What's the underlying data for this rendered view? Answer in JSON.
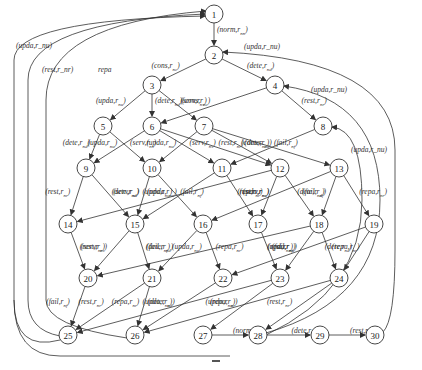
{
  "diagram": {
    "type": "state-transition-graph",
    "nodes": [
      {
        "id": "1",
        "x": 214,
        "y": 14
      },
      {
        "id": "2",
        "x": 214,
        "y": 55
      },
      {
        "id": "3",
        "x": 152,
        "y": 85
      },
      {
        "id": "4",
        "x": 275,
        "y": 85
      },
      {
        "id": "5",
        "x": 103,
        "y": 126
      },
      {
        "id": "6",
        "x": 152,
        "y": 126
      },
      {
        "id": "7",
        "x": 204,
        "y": 126
      },
      {
        "id": "8",
        "x": 323,
        "y": 126
      },
      {
        "id": "9",
        "x": 86,
        "y": 168
      },
      {
        "id": "10",
        "x": 152,
        "y": 168
      },
      {
        "id": "11",
        "x": 222,
        "y": 168
      },
      {
        "id": "12",
        "x": 280,
        "y": 168
      },
      {
        "id": "13",
        "x": 339,
        "y": 168
      },
      {
        "id": "14",
        "x": 68,
        "y": 224
      },
      {
        "id": "15",
        "x": 135,
        "y": 224
      },
      {
        "id": "16",
        "x": 203,
        "y": 224
      },
      {
        "id": "17",
        "x": 258,
        "y": 224
      },
      {
        "id": "18",
        "x": 319,
        "y": 224
      },
      {
        "id": "19",
        "x": 374,
        "y": 224
      },
      {
        "id": "20",
        "x": 88,
        "y": 278
      },
      {
        "id": "21",
        "x": 152,
        "y": 278
      },
      {
        "id": "22",
        "x": 223,
        "y": 278
      },
      {
        "id": "23",
        "x": 280,
        "y": 278
      },
      {
        "id": "24",
        "x": 339,
        "y": 278
      },
      {
        "id": "25",
        "x": 68,
        "y": 335
      },
      {
        "id": "26",
        "x": 135,
        "y": 335
      },
      {
        "id": "27",
        "x": 203,
        "y": 335
      },
      {
        "id": "28",
        "x": 258,
        "y": 335
      },
      {
        "id": "29",
        "x": 320,
        "y": 335
      },
      {
        "id": "30",
        "x": 375,
        "y": 335
      }
    ],
    "edges": [
      {
        "from": "1",
        "to": "2",
        "label": "(norm,r_nn)"
      },
      {
        "from": "2",
        "to": "3",
        "label": "(cons,r_nc)"
      },
      {
        "from": "2",
        "to": "4",
        "label": "(dete,r_nd)"
      },
      {
        "from": "3",
        "to": "5",
        "label": "(upda,r_nu)"
      },
      {
        "from": "3",
        "to": "6",
        "label": "(dete,r_nd)"
      },
      {
        "from": "3",
        "to": "7",
        "label": "(serv,r_ns)"
      },
      {
        "from": "4",
        "to": "6",
        "label": "(cons,r_nc)"
      },
      {
        "from": "4",
        "to": "8",
        "label": "(rest,r_nr)"
      },
      {
        "from": "5",
        "to": "9",
        "label": "(dete,r_nd)"
      },
      {
        "from": "5",
        "to": "10",
        "label": "(serv,r_ns)"
      },
      {
        "from": "6",
        "to": "9",
        "label": "(upda,r_nu)"
      },
      {
        "from": "6",
        "to": "11",
        "label": "(serv,r_ns)"
      },
      {
        "from": "6",
        "to": "12",
        "label": "(rest,r_nr)"
      },
      {
        "from": "7",
        "to": "10",
        "label": "(upda,r_nu)"
      },
      {
        "from": "7",
        "to": "12",
        "label": "(dete,r_nd)"
      },
      {
        "from": "7",
        "to": "13",
        "label": "(fail,r_nf)"
      },
      {
        "from": "8",
        "to": "11",
        "label": "(cons,r_nc)"
      },
      {
        "from": "9",
        "to": "14",
        "label": "(rest,r_nr)"
      },
      {
        "from": "9",
        "to": "15",
        "label": "(serv,r_ns)"
      },
      {
        "from": "10",
        "to": "15",
        "label": "(dete,r_nd)"
      },
      {
        "from": "10",
        "to": "16",
        "label": "(fail,r_nf)"
      },
      {
        "from": "11",
        "to": "17",
        "label": "(serv,r_ns)"
      },
      {
        "from": "11",
        "to": "15",
        "label": "(upda,r_nu)"
      },
      {
        "from": "12",
        "to": "14",
        "label": "(upda,r_nu)"
      },
      {
        "from": "12",
        "to": "17",
        "label": "(rest,r_nr)"
      },
      {
        "from": "12",
        "to": "18",
        "label": "(fail,r_nf)"
      },
      {
        "from": "13",
        "to": "16",
        "label": "(upda,r_nu)"
      },
      {
        "from": "13",
        "to": "18",
        "label": "(dete,r_nd)"
      },
      {
        "from": "13",
        "to": "19",
        "label": "(repa,r_nr)"
      },
      {
        "from": "14",
        "to": "20",
        "label": "(serv,r_ns)"
      },
      {
        "from": "15",
        "to": "20",
        "label": "(rest,r_nr)"
      },
      {
        "from": "15",
        "to": "21",
        "label": "(fail,r_nf)"
      },
      {
        "from": "16",
        "to": "21",
        "label": "(dete,r_nd)"
      },
      {
        "from": "16",
        "to": "22",
        "label": "(repa,r_nr)"
      },
      {
        "from": "17",
        "to": "23",
        "label": "(fail,r_nf)"
      },
      {
        "from": "18",
        "to": "20",
        "label": "(upda,r_nu)"
      },
      {
        "from": "18",
        "to": "23",
        "label": "(rest,r_nr)"
      },
      {
        "from": "18",
        "to": "24",
        "label": "(repa,r_nr)"
      },
      {
        "from": "19",
        "to": "22",
        "label": "(upda,r_nu)"
      },
      {
        "from": "19",
        "to": "24",
        "label": "(dete,r_nd)"
      },
      {
        "from": "20",
        "to": "25",
        "label": "(fail,r_nf)"
      },
      {
        "from": "21",
        "to": "25",
        "label": "(rest,r_nr)"
      },
      {
        "from": "21",
        "to": "26",
        "label": "(repa,r_nr)"
      },
      {
        "from": "22",
        "to": "26",
        "label": "(dete,r_nd)"
      },
      {
        "from": "23",
        "to": "27",
        "label": "(repa,r_nr)"
      },
      {
        "from": "23",
        "to": "25",
        "label": "(upda,r_nu)"
      },
      {
        "from": "24",
        "to": "26",
        "label": "(upda,r_nu)"
      },
      {
        "from": "24",
        "to": "28",
        "label": "(rest,r_nr)"
      },
      {
        "from": "27",
        "to": "28",
        "label": "(norm,r_nn)"
      },
      {
        "from": "28",
        "to": "29",
        "label": "(dete,r_nd)"
      },
      {
        "from": "29",
        "to": "30",
        "label": "(rest,r_nr)"
      },
      {
        "from": "25",
        "to": "1",
        "label": "(upda,r_nu)"
      },
      {
        "from": "25",
        "to": "1",
        "label": "(rest,r_nr)"
      },
      {
        "from": "26",
        "to": "1",
        "label": "repa"
      },
      {
        "from": "30",
        "to": "2",
        "label": "(upda,r_nu)"
      },
      {
        "from": "28",
        "to": "4",
        "label": "(upda,r_nu)"
      },
      {
        "from": "28",
        "to": "8",
        "label": "(upda,r_nu)"
      }
    ],
    "footer_mark": "–"
  }
}
